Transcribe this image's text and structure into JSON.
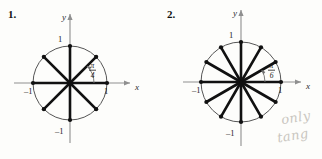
{
  "page": {
    "background": "#fdfdfb",
    "width": 322,
    "height": 159
  },
  "figures": [
    {
      "number": "1.",
      "name": "unit-circle-pi-over-4",
      "center": {
        "x": 70,
        "y": 83
      },
      "radius": 37,
      "divisions": 8,
      "angle_step_label_numerator": "π",
      "angle_step_label_denominator": "4",
      "axis_labels": {
        "x": "x",
        "y": "y"
      },
      "tick_labels": {
        "x_positive": "1",
        "x_negative": "–1",
        "y_positive": "1",
        "y_negative": "–1"
      },
      "spoke_angles_deg": [
        0,
        45,
        90,
        135,
        180,
        225,
        270,
        315
      ],
      "point_marker": "filled-dot"
    },
    {
      "number": "2.",
      "name": "unit-circle-pi-over-6",
      "center": {
        "x": 80,
        "y": 82
      },
      "radius": 40,
      "divisions": 12,
      "angle_step_label_numerator": "π",
      "angle_step_label_denominator": "6",
      "axis_labels": {
        "x": "x",
        "y": "y"
      },
      "tick_labels": {
        "x_positive": "1",
        "x_negative": "–1",
        "y_positive": "1",
        "y_negative": "–1"
      },
      "spoke_angles_deg": [
        0,
        30,
        60,
        90,
        120,
        150,
        180,
        210,
        240,
        270,
        300,
        330
      ],
      "point_marker": "filled-dot"
    }
  ],
  "annotations": {
    "handwriting_line1": "only",
    "handwriting_line2": "tang",
    "handwriting_color": "#c9c6c0"
  },
  "colors": {
    "spoke": "#111111",
    "circle": "#4a4a4a",
    "axis": "#8a8a8a",
    "text": "#1a1a1a"
  }
}
